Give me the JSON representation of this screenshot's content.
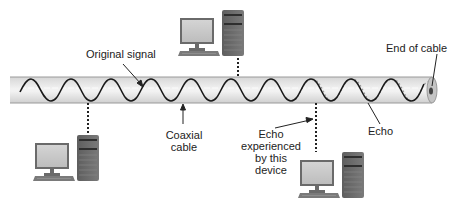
{
  "diagram": {
    "type": "coaxial-cable-echo-illustration",
    "labels": {
      "original_signal": "Original signal",
      "end_of_cable": "End of cable",
      "coaxial_cable": [
        "Coaxial",
        "cable"
      ],
      "echo": "Echo",
      "echo_experienced": [
        "Echo",
        "experienced",
        "by this",
        "device"
      ]
    },
    "colors": {
      "cable_fill": "#e4e4e4",
      "cable_edge": "#9a9a9a",
      "signal_wave": "#1a1a1a",
      "echo_wave": "#9a9a9a",
      "computer_dark": "#6e6e6e",
      "computer_screen": "#c8c8c8",
      "connector": "#222222"
    },
    "devices": [
      {
        "name": "top-computer",
        "position": "above cable"
      },
      {
        "name": "bottom-left-computer",
        "position": "below cable, left"
      },
      {
        "name": "bottom-right-computer",
        "position": "below cable, right",
        "note": "Echo experienced by this device"
      }
    ]
  }
}
